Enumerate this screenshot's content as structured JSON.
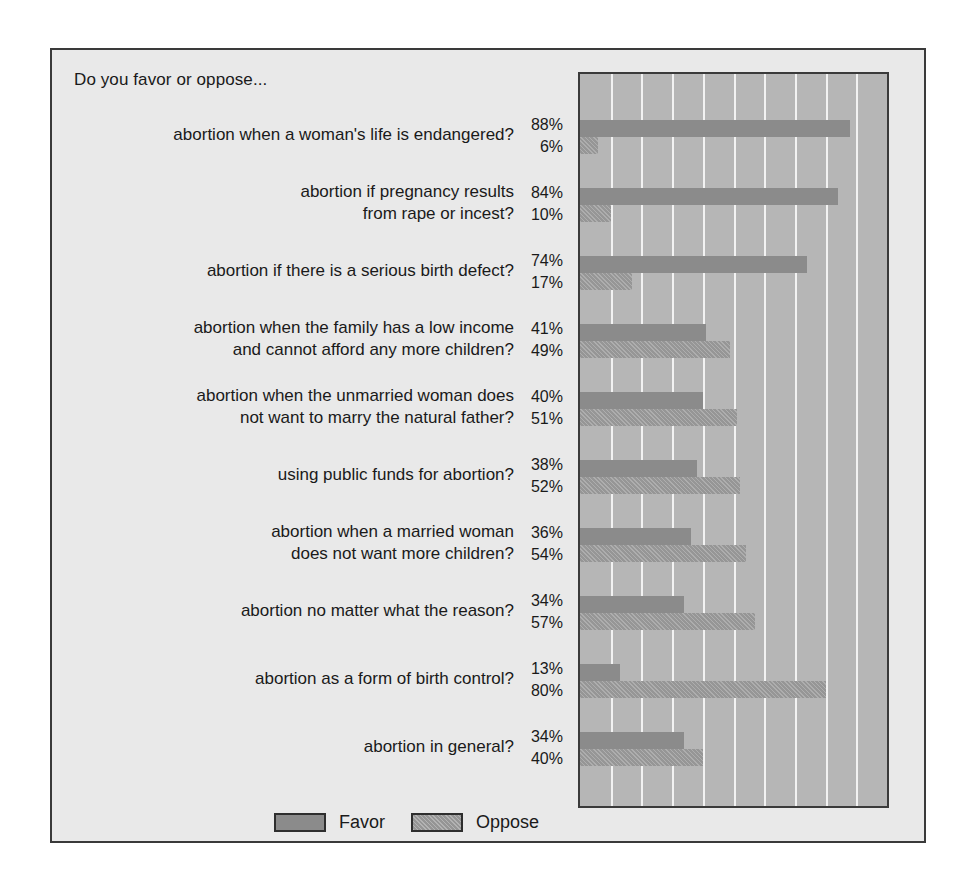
{
  "chart_data": {
    "type": "bar",
    "orientation": "horizontal",
    "title": "Do you favor or oppose...",
    "xlabel": "",
    "ylabel": "",
    "xlim": [
      0,
      100
    ],
    "grid": true,
    "grid_interval": 10,
    "legend_position": "bottom-left",
    "value_suffix": "%",
    "categories": [
      "abortion when a woman's life is endangered?",
      "abortion if pregnancy results\nfrom rape or incest?",
      "abortion if there is a serious birth defect?",
      "abortion when the family has a low income\nand cannot afford any more children?",
      "abortion when the unmarried woman does\nnot want to marry the natural father?",
      "using public funds for abortion?",
      "abortion when a married woman\ndoes not want more children?",
      "abortion no matter what the reason?",
      "abortion as a form of birth control?",
      "abortion in general?"
    ],
    "series": [
      {
        "name": "Favor",
        "color": "#8b8b8b",
        "values": [
          88,
          84,
          74,
          41,
          40,
          38,
          36,
          34,
          13,
          34
        ],
        "labels": [
          "88%",
          "84%",
          "74%",
          "41%",
          "40%",
          "38%",
          "36%",
          "34%",
          "13%",
          "34%"
        ]
      },
      {
        "name": "Oppose",
        "color": "#9e9e9e",
        "values": [
          6,
          10,
          17,
          49,
          51,
          52,
          54,
          57,
          80,
          40
        ],
        "labels": [
          "6%",
          "10%",
          "17%",
          "49%",
          "51%",
          "52%",
          "54%",
          "57%",
          "80%",
          "40%"
        ]
      }
    ]
  },
  "legend": {
    "items": [
      {
        "label": "Favor",
        "swatch": "favor"
      },
      {
        "label": "Oppose",
        "swatch": "oppose"
      }
    ]
  },
  "colors": {
    "figure_background": "#e9e9e9",
    "plot_background": "#b6b6b6",
    "gridline": "#f2f2f2",
    "border": "#3a3a3a",
    "favor": "#8b8b8b",
    "oppose": "#9e9e9e",
    "text": "#1a1a1a"
  }
}
